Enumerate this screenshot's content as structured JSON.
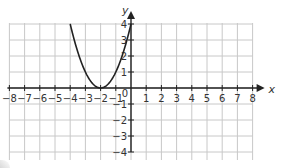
{
  "chart_data": {
    "type": "line",
    "title": "",
    "xlabel": "x",
    "ylabel": "y",
    "xlim": [
      -8,
      8
    ],
    "ylim": [
      -4,
      4
    ],
    "grid": true,
    "x_ticks": [
      "-8",
      "-7",
      "-6",
      "-5",
      "-4",
      "-3",
      "-2",
      "-1",
      "1",
      "2",
      "3",
      "4",
      "5",
      "6",
      "7",
      "8"
    ],
    "y_ticks": [
      "4",
      "3",
      "2",
      "1",
      "-1",
      "-2",
      "-3",
      "-4"
    ],
    "origin_label": "0",
    "series": [
      {
        "name": "y = (x + 2)^2",
        "equation": "y = (x + 2)^2",
        "vertex": [
          -2,
          0
        ],
        "points": [
          [
            -4,
            4
          ],
          [
            -3,
            1
          ],
          [
            -2,
            0
          ],
          [
            -1,
            1
          ],
          [
            0,
            4
          ]
        ],
        "color": "#222222"
      }
    ],
    "legend": null
  },
  "style": {
    "grid_color": "#c8c8c8",
    "axis_color": "#222222",
    "curve_color": "#222222"
  }
}
